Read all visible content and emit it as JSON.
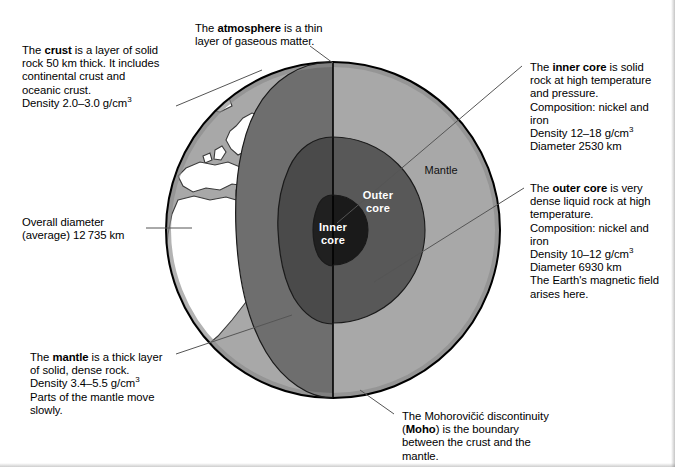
{
  "colors": {
    "background": "#ffffff",
    "ocean": "#a8a8a8",
    "land": "#ffffff",
    "mantle": "#a8a8a8",
    "mantle_cut": "#6e6e6e",
    "outer_core": "#585858",
    "outer_core_cut": "#4a4a4a",
    "inner_core": "#1a1a1a",
    "inner_core_cut": "#202020",
    "outline": "#000000",
    "leader_line": "#555555"
  },
  "globe": {
    "center_x": 333,
    "center_y": 230,
    "radius_x": 167,
    "radius_y": 168,
    "cut_line_x": 333
  },
  "interior_labels": [
    {
      "name": "mantle",
      "text": "Mantle",
      "x": 441,
      "y": 170
    },
    {
      "name": "outer-core",
      "text": "Outer\ncore",
      "x": 377,
      "y": 196
    },
    {
      "name": "inner-core",
      "text": "Inner\ncore",
      "x": 332,
      "y": 227
    }
  ],
  "callouts": {
    "crust": {
      "name": "crust",
      "lines": [
        {
          "segments": [
            {
              "t": "The "
            },
            {
              "t": "crust",
              "b": true
            },
            {
              "t": " is a layer of solid"
            }
          ]
        },
        {
          "segments": [
            {
              "t": "rock 50 km thick. It includes"
            }
          ]
        },
        {
          "segments": [
            {
              "t": "continental crust and"
            }
          ]
        },
        {
          "segments": [
            {
              "t": "oceanic crust."
            }
          ]
        },
        {
          "segments": [
            {
              "t": "Density 2.0–3.0 g/cm"
            },
            {
              "t": "3",
              "sup": true
            }
          ]
        }
      ],
      "x": 22,
      "y": 44
    },
    "atmosphere": {
      "name": "atmosphere",
      "lines": [
        {
          "segments": [
            {
              "t": "The "
            },
            {
              "t": "atmosphere",
              "b": true
            },
            {
              "t": " is a thin"
            }
          ]
        },
        {
          "segments": [
            {
              "t": "layer of gaseous matter."
            }
          ]
        }
      ],
      "x": 195,
      "y": 22
    },
    "inner_core": {
      "name": "inner-core",
      "lines": [
        {
          "segments": [
            {
              "t": "The "
            },
            {
              "t": "inner core",
              "b": true
            },
            {
              "t": " is solid"
            }
          ]
        },
        {
          "segments": [
            {
              "t": "rock at high temperature"
            }
          ]
        },
        {
          "segments": [
            {
              "t": "and pressure."
            }
          ]
        },
        {
          "segments": [
            {
              "t": "Composition: nickel and"
            }
          ]
        },
        {
          "segments": [
            {
              "t": "iron"
            }
          ]
        },
        {
          "segments": [
            {
              "t": "Density 12–18 g/cm"
            },
            {
              "t": "3",
              "sup": true
            }
          ]
        },
        {
          "segments": [
            {
              "t": "Diameter 2530 km"
            }
          ]
        }
      ],
      "x": 530,
      "y": 61
    },
    "outer_core": {
      "name": "outer-core",
      "lines": [
        {
          "segments": [
            {
              "t": "The "
            },
            {
              "t": "outer core",
              "b": true
            },
            {
              "t": " is very"
            }
          ]
        },
        {
          "segments": [
            {
              "t": "dense liquid rock at high"
            }
          ]
        },
        {
          "segments": [
            {
              "t": "temperature."
            }
          ]
        },
        {
          "segments": [
            {
              "t": "Composition: nickel and"
            }
          ]
        },
        {
          "segments": [
            {
              "t": "iron"
            }
          ]
        },
        {
          "segments": [
            {
              "t": "Density 10–12 g/cm"
            },
            {
              "t": "3",
              "sup": true
            }
          ]
        },
        {
          "segments": [
            {
              "t": "Diameter 6930 km"
            }
          ]
        },
        {
          "segments": [
            {
              "t": "The Earth's magnetic field"
            }
          ]
        },
        {
          "segments": [
            {
              "t": "arises here."
            }
          ]
        }
      ],
      "x": 530,
      "y": 182
    },
    "overall_diameter": {
      "name": "overall-diameter",
      "lines": [
        {
          "segments": [
            {
              "t": "Overall diameter"
            }
          ]
        },
        {
          "segments": [
            {
              "t": "(average) 12 735 km"
            }
          ]
        }
      ],
      "x": 22,
      "y": 216
    },
    "mantle": {
      "name": "mantle",
      "lines": [
        {
          "segments": [
            {
              "t": "The "
            },
            {
              "t": "mantle",
              "b": true
            },
            {
              "t": " is a thick layer"
            }
          ]
        },
        {
          "segments": [
            {
              "t": "of solid, dense rock."
            }
          ]
        },
        {
          "segments": [
            {
              "t": "Density 3.4–5.5 g/cm"
            },
            {
              "t": "3",
              "sup": true
            }
          ]
        },
        {
          "segments": [
            {
              "t": "Parts of the mantle move"
            }
          ]
        },
        {
          "segments": [
            {
              "t": "slowly."
            }
          ]
        }
      ],
      "x": 30,
      "y": 351
    },
    "moho": {
      "name": "moho",
      "lines": [
        {
          "segments": [
            {
              "t": "The Mohorovičić discontinuity"
            }
          ]
        },
        {
          "segments": [
            {
              "t": "("
            },
            {
              "t": "Moho",
              "b": true
            },
            {
              "t": ") is the boundary"
            }
          ]
        },
        {
          "segments": [
            {
              "t": "between the crust and the"
            }
          ]
        },
        {
          "segments": [
            {
              "t": "mantle."
            }
          ]
        }
      ],
      "x": 402,
      "y": 410
    }
  },
  "leader_lines": [
    {
      "name": "crust-leader",
      "x1": 176,
      "y1": 106,
      "x2": 260,
      "y2": 71
    },
    {
      "name": "atmosphere-leader",
      "x1": 310,
      "y1": 46,
      "x2": 333,
      "y2": 62
    },
    {
      "name": "inner-core-leader",
      "x1": 522,
      "y1": 65,
      "x2": 336,
      "y2": 222
    },
    {
      "name": "outer-core-leader",
      "x1": 524,
      "y1": 188,
      "x2": 376,
      "y2": 280
    },
    {
      "name": "overall-diameter-leader",
      "x1": 146,
      "y1": 228,
      "x2": 192,
      "y2": 228
    },
    {
      "name": "mantle-leader",
      "x1": 176,
      "y1": 354,
      "x2": 290,
      "y2": 316
    },
    {
      "name": "moho-leader",
      "x1": 394,
      "y1": 414,
      "x2": 362,
      "y2": 389
    }
  ]
}
